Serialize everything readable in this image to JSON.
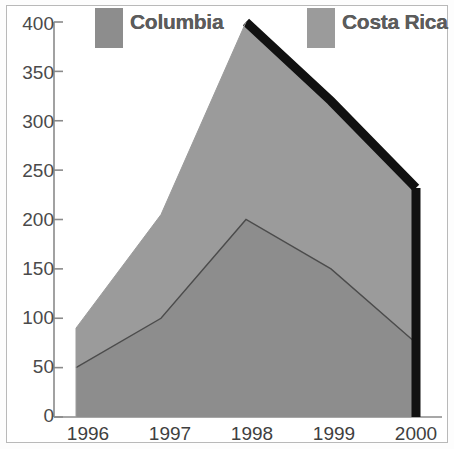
{
  "chart_data": {
    "type": "area",
    "title": "",
    "xlabel": "",
    "ylabel": "",
    "categories": [
      "1996",
      "1997",
      "1998",
      "1999",
      "2000"
    ],
    "x": [
      1996,
      1997,
      1998,
      1999,
      2000
    ],
    "stacked": true,
    "series": [
      {
        "name": "Columbia",
        "values": [
          50,
          100,
          200,
          150,
          75
        ],
        "color": "#8d8d8d"
      },
      {
        "name": "Costa Rica",
        "values": [
          40,
          105,
          200,
          170,
          157
        ],
        "color": "#9b9b9b"
      }
    ],
    "cumulative_totals": [
      90,
      205,
      400,
      320,
      232
    ],
    "ylim": [
      0,
      400
    ],
    "yticks": [
      0,
      50,
      100,
      150,
      200,
      250,
      300,
      350,
      400
    ],
    "ytick_labels": [
      "0",
      "50",
      "100",
      "150",
      "200",
      "250",
      "300",
      "350",
      "400"
    ],
    "xtick_labels": [
      "1996",
      "1997",
      "1998",
      "1999",
      "2000"
    ],
    "grid": false,
    "legend_position": "top",
    "legend": [
      {
        "label": "Columbia",
        "color": "#8d8d8d"
      },
      {
        "label": "Costa Rica",
        "color": "#9b9b9b"
      }
    ],
    "annotations": {
      "top_edge_stroke_color": "#111111",
      "top_edge_stroke_note": "thick black outline on descending total edge 1998-2000"
    }
  },
  "axis": {
    "y_labels": [
      "400",
      "350",
      "300",
      "250",
      "200",
      "150",
      "100",
      "50",
      "0"
    ],
    "x_labels": [
      "1996",
      "1997",
      "1998",
      "1999",
      "2000"
    ]
  },
  "legend": {
    "columbia": "Columbia",
    "costa_rica": "Costa Rica"
  },
  "colors": {
    "columbia": "#8d8d8d",
    "costa_rica": "#9b9b9b",
    "axis": "#8a8a8a",
    "outline": "#111111",
    "series_line": "#4b4b4b",
    "frame": "#b9b9b9",
    "text": "#4a4a4a",
    "legend_text": "#5c5c5c",
    "background": "#ffffff"
  }
}
